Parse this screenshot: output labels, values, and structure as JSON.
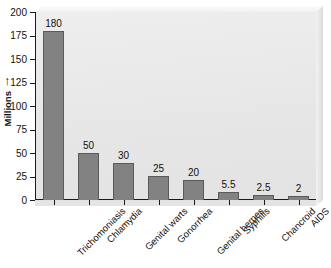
{
  "chart_data": {
    "type": "bar",
    "title": "",
    "xlabel": "",
    "ylabel": "Millions",
    "ylabel_arrow": "↑",
    "ylim": [
      0,
      200
    ],
    "yticks": [
      0,
      25,
      50,
      75,
      100,
      125,
      150,
      175,
      200
    ],
    "ytick_labels": [
      "0",
      "25",
      "50",
      "75",
      "100",
      "125",
      "150",
      "175",
      "200"
    ],
    "grid": false,
    "legend": false,
    "orientation": "vertical",
    "categories": [
      "Trichomoniasis",
      "Chlamydia",
      "Genital warts",
      "Gonorrhea",
      "Genital herpes",
      "Syphilis",
      "Chancroid",
      "AIDS"
    ],
    "values": [
      180,
      50,
      30,
      25,
      20,
      5.5,
      2.5,
      2
    ],
    "value_labels": [
      "180",
      "50",
      "30",
      "25",
      "20",
      "5.5",
      "2.5",
      "2"
    ],
    "bar_pixel_values": [
      180,
      50,
      39,
      26,
      21,
      9,
      5.5,
      4
    ],
    "colors": {
      "bar_fill": "#828282",
      "bar_stroke": "#5a5a5a",
      "panel_background": "#e9e9e9",
      "axis": "#1a1a1a",
      "text": "#111111",
      "figure_background": "#ffffff"
    }
  }
}
